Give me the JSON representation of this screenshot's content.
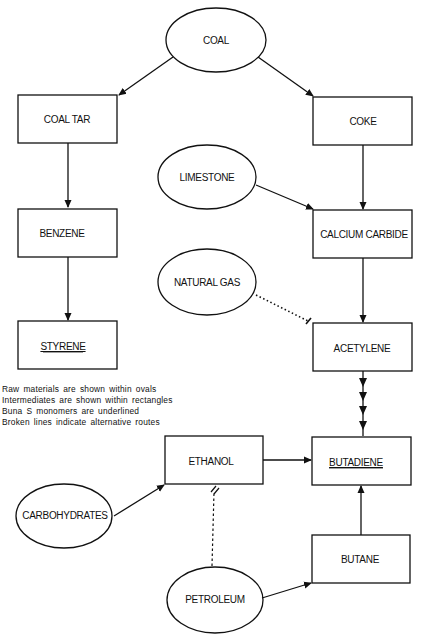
{
  "diagram": {
    "nodes": {
      "coal": {
        "label": "COAL",
        "shape": "oval",
        "type": "raw material"
      },
      "coal_tar": {
        "label": "COAL TAR",
        "shape": "rectangle",
        "type": "intermediate"
      },
      "coke": {
        "label": "COKE",
        "shape": "rectangle",
        "type": "intermediate"
      },
      "limestone": {
        "label": "LIMESTONE",
        "shape": "oval",
        "type": "raw material"
      },
      "benzene": {
        "label": "BENZENE",
        "shape": "rectangle",
        "type": "intermediate"
      },
      "calcium_carbide": {
        "label": "CALCIUM CARBIDE",
        "shape": "rectangle",
        "type": "intermediate"
      },
      "natural_gas": {
        "label": "NATURAL GAS",
        "shape": "oval",
        "type": "raw material"
      },
      "styrene": {
        "label": "STYRENE",
        "shape": "rectangle",
        "type": "monomer",
        "underlined": true
      },
      "acetylene": {
        "label": "ACETYLENE",
        "shape": "rectangle",
        "type": "intermediate"
      },
      "ethanol": {
        "label": "ETHANOL",
        "shape": "rectangle",
        "type": "intermediate"
      },
      "butadiene": {
        "label": "BUTADIENE",
        "shape": "rectangle",
        "type": "monomer",
        "underlined": true
      },
      "carbohydrates": {
        "label": "CARBOHYDRATES",
        "shape": "oval",
        "type": "raw material"
      },
      "butane": {
        "label": "BUTANE",
        "shape": "rectangle",
        "type": "intermediate"
      },
      "petroleum": {
        "label": "PETROLEUM",
        "shape": "oval",
        "type": "raw material"
      }
    },
    "edges": [
      {
        "from": "COAL",
        "to": "COAL TAR",
        "style": "solid"
      },
      {
        "from": "COAL",
        "to": "COKE",
        "style": "solid"
      },
      {
        "from": "COAL TAR",
        "to": "BENZENE",
        "style": "solid"
      },
      {
        "from": "BENZENE",
        "to": "STYRENE",
        "style": "solid"
      },
      {
        "from": "COKE",
        "to": "CALCIUM CARBIDE",
        "style": "solid"
      },
      {
        "from": "LIMESTONE",
        "to": "CALCIUM CARBIDE",
        "style": "solid"
      },
      {
        "from": "CALCIUM CARBIDE",
        "to": "ACETYLENE",
        "style": "solid"
      },
      {
        "from": "NATURAL GAS",
        "to": "ACETYLENE",
        "style": "dotted"
      },
      {
        "from": "ACETYLENE",
        "to": "BUTADIENE",
        "style": "solid",
        "arrowheads": 4
      },
      {
        "from": "ETHANOL",
        "to": "BUTADIENE",
        "style": "solid"
      },
      {
        "from": "CARBOHYDRATES",
        "to": "ETHANOL",
        "style": "solid"
      },
      {
        "from": "PETROLEUM",
        "to": "ETHANOL",
        "style": "dotted"
      },
      {
        "from": "PETROLEUM",
        "to": "BUTANE",
        "style": "solid"
      },
      {
        "from": "BUTANE",
        "to": "BUTADIENE",
        "style": "solid"
      }
    ],
    "legend": [
      "Raw materials are shown within ovals",
      "Intermediates are shown within rectangles",
      "Buna S monomers are underlined",
      "Broken lines indicate alternative routes"
    ],
    "colors": {
      "stroke": "#111111",
      "background": "#ffffff"
    }
  }
}
